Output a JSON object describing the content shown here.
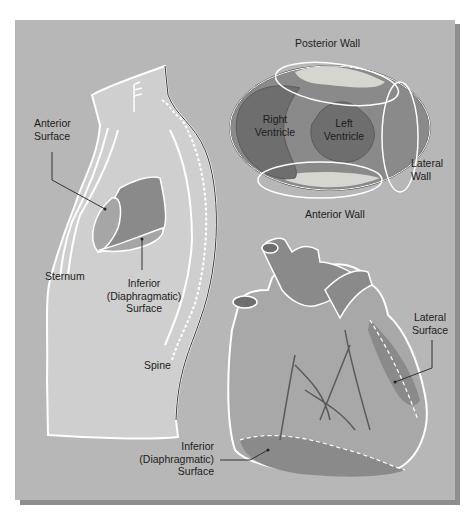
{
  "figure": {
    "background_color": "#b7b7b7",
    "shadow_color": "#8e8e8e",
    "outline_color": "#ffffff",
    "myocardium_color": "#8a8a8a",
    "cavity_color": "#6e6e6e",
    "thorax_color": "#cfcfcf"
  },
  "thorax_view": {
    "labels": {
      "anterior_surface_1": "Anterior",
      "anterior_surface_2": "Surface",
      "sternum": "Sternum",
      "inferior_1": "Inferior",
      "inferior_2": "(Diaphragmatic)",
      "inferior_3": "Surface",
      "spine": "Spine"
    }
  },
  "cross_section_view": {
    "labels": {
      "posterior_wall": "Posterior Wall",
      "right_ventricle_1": "Right",
      "right_ventricle_2": "Ventricle",
      "left_ventricle_1": "Left",
      "left_ventricle_2": "Ventricle",
      "lateral_wall_1": "Lateral",
      "lateral_wall_2": "Wall",
      "anterior_wall": "Anterior Wall"
    }
  },
  "heart_view": {
    "labels": {
      "lateral_surface_1": "Lateral",
      "lateral_surface_2": "Surface",
      "inferior_1": "Inferior",
      "inferior_2": "(Diaphragmatic)",
      "inferior_3": "Surface"
    }
  }
}
